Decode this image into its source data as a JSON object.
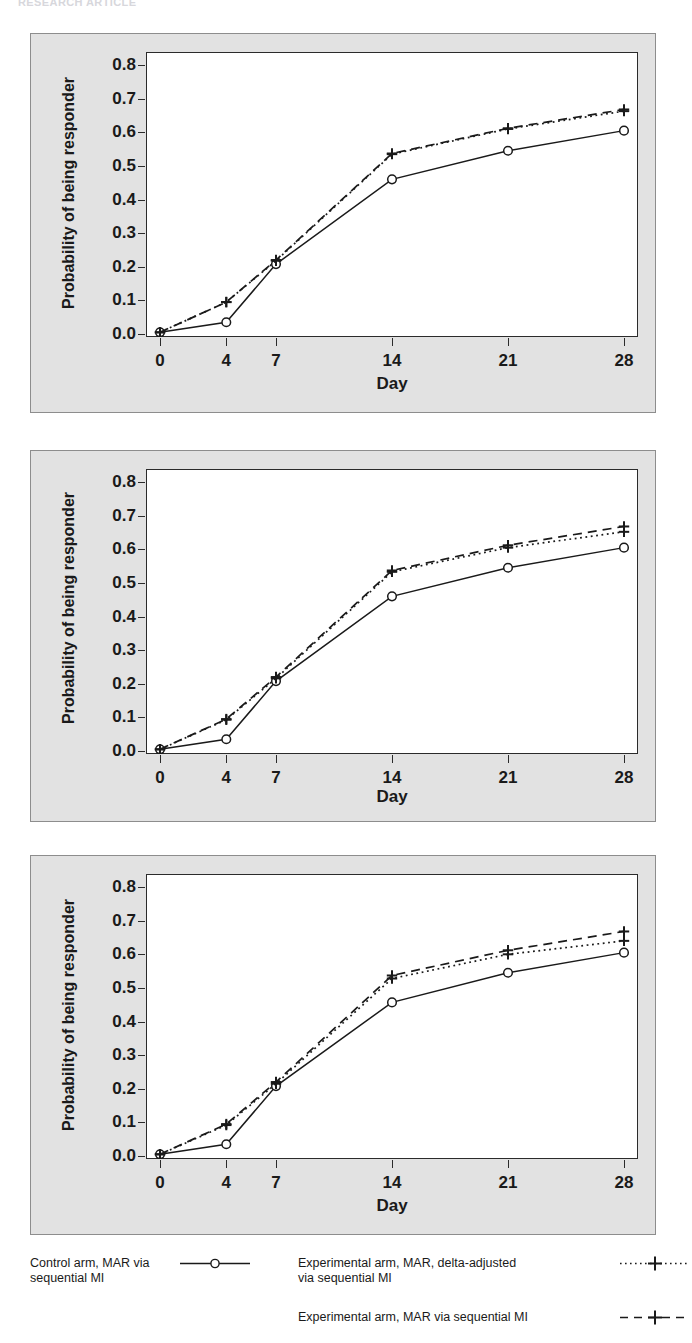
{
  "top_fragment": "RESEARCH ARTICLE",
  "charts": [
    {
      "panel_id": "panel-1",
      "ylabel": "Probability of being responder",
      "xlabel": "Day"
    },
    {
      "panel_id": "panel-2",
      "ylabel": "Probability of being responder",
      "xlabel": "Day"
    },
    {
      "panel_id": "panel-3",
      "ylabel": "Probability of being responder",
      "xlabel": "Day"
    }
  ],
  "axis": {
    "yticks": [
      "0.0",
      "0.1",
      "0.2",
      "0.3",
      "0.4",
      "0.5",
      "0.6",
      "0.7",
      "0.8"
    ],
    "xticks": [
      "0",
      "4",
      "7",
      "14",
      "21",
      "28"
    ]
  },
  "legend": {
    "entries": [
      {
        "label": "Control arm, MAR via\nsequential MI",
        "style": "solid",
        "marker": "circle"
      },
      {
        "label": "Experimental arm, MAR, delta-adjusted\nvia sequential MI",
        "style": "dotted",
        "marker": "plus"
      },
      {
        "label": "Experimental arm, MAR via sequential MI",
        "style": "dashed",
        "marker": "plus"
      }
    ]
  },
  "chart_data": [
    {
      "type": "line",
      "title": "",
      "xlabel": "Day",
      "ylabel": "Probability of being responder",
      "x": [
        0,
        4,
        7,
        14,
        21,
        28
      ],
      "xlim": [
        0,
        28
      ],
      "ylim": [
        0.0,
        0.83
      ],
      "xticks": [
        0,
        4,
        7,
        14,
        21,
        28
      ],
      "yticks": [
        0.0,
        0.1,
        0.2,
        0.3,
        0.4,
        0.5,
        0.6,
        0.7,
        0.8
      ],
      "grid": false,
      "legend_position": "below-figure",
      "series": [
        {
          "name": "Control arm, MAR via sequential MI",
          "style": "solid",
          "marker": "circle",
          "values": [
            0.005,
            0.035,
            0.208,
            0.46,
            0.545,
            0.605
          ]
        },
        {
          "name": "Experimental arm, MAR, delta-adjusted via sequential MI",
          "style": "dotted",
          "marker": "plus",
          "values": [
            0.005,
            0.095,
            0.218,
            0.535,
            0.61,
            0.663
          ]
        },
        {
          "name": "Experimental arm, MAR via sequential MI",
          "style": "dashed",
          "marker": "plus",
          "values": [
            0.005,
            0.095,
            0.22,
            0.537,
            0.612,
            0.668
          ]
        }
      ]
    },
    {
      "type": "line",
      "title": "",
      "xlabel": "Day",
      "ylabel": "Probability of being responder",
      "x": [
        0,
        4,
        7,
        14,
        21,
        28
      ],
      "xlim": [
        0,
        28
      ],
      "ylim": [
        0.0,
        0.83
      ],
      "xticks": [
        0,
        4,
        7,
        14,
        21,
        28
      ],
      "yticks": [
        0.0,
        0.1,
        0.2,
        0.3,
        0.4,
        0.5,
        0.6,
        0.7,
        0.8
      ],
      "grid": false,
      "legend_position": "below-figure",
      "series": [
        {
          "name": "Control arm, MAR via sequential MI",
          "style": "solid",
          "marker": "circle",
          "values": [
            0.005,
            0.035,
            0.208,
            0.46,
            0.545,
            0.605
          ]
        },
        {
          "name": "Experimental arm, MAR, delta-adjusted via sequential MI",
          "style": "dotted",
          "marker": "plus",
          "values": [
            0.005,
            0.093,
            0.216,
            0.533,
            0.605,
            0.652
          ]
        },
        {
          "name": "Experimental arm, MAR via sequential MI",
          "style": "dashed",
          "marker": "plus",
          "values": [
            0.005,
            0.095,
            0.22,
            0.537,
            0.612,
            0.668
          ]
        }
      ]
    },
    {
      "type": "line",
      "title": "",
      "xlabel": "Day",
      "ylabel": "Probability of being responder",
      "x": [
        0,
        4,
        7,
        14,
        21,
        28
      ],
      "xlim": [
        0,
        28
      ],
      "ylim": [
        0.0,
        0.83
      ],
      "xticks": [
        0,
        4,
        7,
        14,
        21,
        28
      ],
      "yticks": [
        0.0,
        0.1,
        0.2,
        0.3,
        0.4,
        0.5,
        0.6,
        0.7,
        0.8
      ],
      "grid": false,
      "legend_position": "below-figure",
      "series": [
        {
          "name": "Control arm, MAR via sequential MI",
          "style": "solid",
          "marker": "circle",
          "values": [
            0.005,
            0.035,
            0.208,
            0.457,
            0.545,
            0.605
          ]
        },
        {
          "name": "Experimental arm, MAR, delta-adjusted via sequential MI",
          "style": "dotted",
          "marker": "plus",
          "values": [
            0.005,
            0.092,
            0.215,
            0.528,
            0.6,
            0.64
          ]
        },
        {
          "name": "Experimental arm, MAR via sequential MI",
          "style": "dashed",
          "marker": "plus",
          "values": [
            0.005,
            0.095,
            0.22,
            0.537,
            0.612,
            0.668
          ]
        }
      ]
    }
  ]
}
